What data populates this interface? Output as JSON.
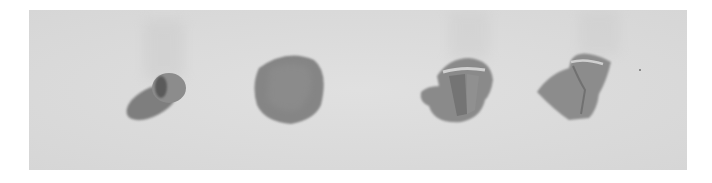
{
  "image": {
    "alt": "Four grey clay shapes on a paper surface showing stages of forming a clay rose: a small bud, a flattened disc, a partly wrapped petal, and a finished rolled rose",
    "background_color": "#ffffff",
    "paper_color": "#dcdcdc",
    "clay_color": "#8e8e8e",
    "shadow_color": "#6f6f6f",
    "objects": [
      {
        "name": "clay-bud",
        "description": "small teardrop bud with shadow"
      },
      {
        "name": "clay-disc",
        "description": "flattened rounded petal disc"
      },
      {
        "name": "clay-wrapped-petal",
        "description": "petal wrapped around bud"
      },
      {
        "name": "clay-rose",
        "description": "rolled rose with open petal"
      }
    ]
  }
}
